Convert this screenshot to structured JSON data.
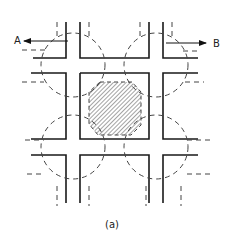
{
  "diagram": {
    "labels": {
      "left_arrow": "A",
      "right_arrow": "B",
      "caption": "(a)"
    },
    "colors": {
      "solid_line": "#1a1a1a",
      "dashed_line": "#444444",
      "hatch": "#555555",
      "background": "#ffffff"
    }
  }
}
